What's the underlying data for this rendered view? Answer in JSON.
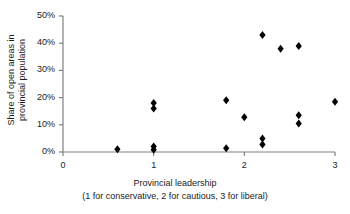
{
  "chart_data": {
    "type": "scatter",
    "title": "",
    "xlabel": "Provincial leadership",
    "xlabel_sub": "(1 for conservative, 2 for cautious, 3 for liberal)",
    "ylabel": "Share of open areas in",
    "ylabel_line2": "provincial population",
    "xlim": [
      0,
      3
    ],
    "ylim": [
      0,
      50
    ],
    "xticks": [
      "0",
      "1",
      "2",
      "3"
    ],
    "xtick_values": [
      0,
      1,
      2,
      3
    ],
    "yticks": [
      "0%",
      "10%",
      "20%",
      "30%",
      "40%",
      "50%"
    ],
    "ytick_values": [
      0,
      10,
      20,
      30,
      40,
      50
    ],
    "grid": false,
    "legend": "none",
    "marker": "diamond",
    "marker_color": "#000000",
    "points": [
      {
        "x": 0.6,
        "y": 1.0
      },
      {
        "x": 1.0,
        "y": 0.8
      },
      {
        "x": 1.0,
        "y": 2.0
      },
      {
        "x": 1.0,
        "y": 16.0
      },
      {
        "x": 1.0,
        "y": 18.0
      },
      {
        "x": 1.8,
        "y": 1.4
      },
      {
        "x": 1.8,
        "y": 19.0
      },
      {
        "x": 2.0,
        "y": 12.8
      },
      {
        "x": 2.2,
        "y": 2.8
      },
      {
        "x": 2.2,
        "y": 5.0
      },
      {
        "x": 2.2,
        "y": 43.0
      },
      {
        "x": 2.4,
        "y": 38.0
      },
      {
        "x": 2.6,
        "y": 10.5
      },
      {
        "x": 2.6,
        "y": 13.5
      },
      {
        "x": 2.6,
        "y": 39.0
      },
      {
        "x": 3.0,
        "y": 18.5
      }
    ]
  },
  "axis": {
    "line_color": "#808080",
    "text_color": "#1a1a1a"
  }
}
